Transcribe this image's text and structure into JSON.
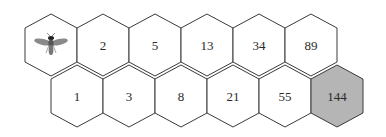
{
  "diagram": {
    "title": "",
    "start_icon": "bee-icon",
    "top_row": [
      {
        "label": "",
        "icon": "bee-icon",
        "highlighted": false
      },
      {
        "label": "2",
        "highlighted": false
      },
      {
        "label": "5",
        "highlighted": false
      },
      {
        "label": "13",
        "highlighted": false
      },
      {
        "label": "34",
        "highlighted": false
      },
      {
        "label": "89",
        "highlighted": false
      }
    ],
    "bottom_row": [
      {
        "label": "1",
        "highlighted": false
      },
      {
        "label": "3",
        "highlighted": false
      },
      {
        "label": "8",
        "highlighted": false
      },
      {
        "label": "21",
        "highlighted": false
      },
      {
        "label": "55",
        "highlighted": false
      },
      {
        "label": "144",
        "highlighted": true
      }
    ],
    "colors": {
      "cell_fill": "#ffffff",
      "highlight_fill": "#b5b5b5",
      "stroke": "#3a3a3a"
    }
  }
}
